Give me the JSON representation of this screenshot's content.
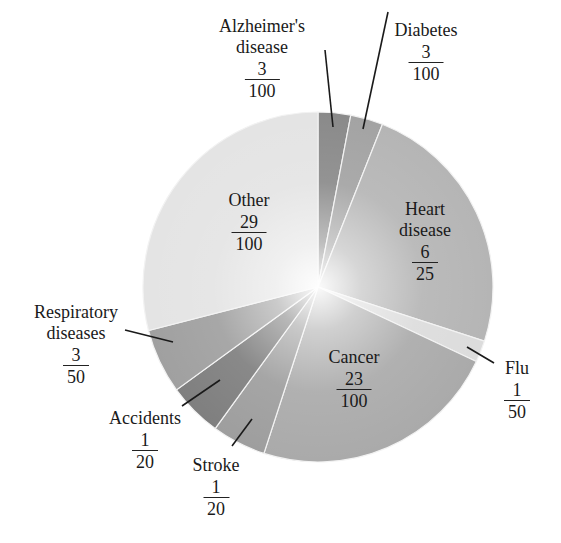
{
  "chart_data": {
    "type": "pie",
    "title": "",
    "start_angle_deg": 0,
    "direction": "clockwise",
    "slices": [
      {
        "name": "Alzheimer's disease",
        "label_lines": [
          "Alzheimer's",
          "disease"
        ],
        "num": "3",
        "den": "100",
        "value": 0.03,
        "color": "#8a8a8a"
      },
      {
        "name": "Diabetes",
        "label_lines": [
          "Diabetes"
        ],
        "num": "3",
        "den": "100",
        "value": 0.03,
        "color": "#a3a3a3"
      },
      {
        "name": "Heart disease",
        "label_lines": [
          "Heart",
          "disease"
        ],
        "num": "6",
        "den": "25",
        "value": 0.24,
        "color": "#b5b5b5"
      },
      {
        "name": "Flu",
        "label_lines": [
          "Flu"
        ],
        "num": "1",
        "den": "50",
        "value": 0.02,
        "color": "#dcdcdc"
      },
      {
        "name": "Cancer",
        "label_lines": [
          "Cancer"
        ],
        "num": "23",
        "den": "100",
        "value": 0.23,
        "color": "#aaaaaa"
      },
      {
        "name": "Stroke",
        "label_lines": [
          "Stroke"
        ],
        "num": "1",
        "den": "20",
        "value": 0.05,
        "color": "#9e9e9e"
      },
      {
        "name": "Accidents",
        "label_lines": [
          "Accidents"
        ],
        "num": "1",
        "den": "20",
        "value": 0.05,
        "color": "#7f7f7f"
      },
      {
        "name": "Respiratory diseases",
        "label_lines": [
          "Respiratory",
          "diseases"
        ],
        "num": "3",
        "den": "50",
        "value": 0.06,
        "color": "#a0a0a0"
      },
      {
        "name": "Other",
        "label_lines": [
          "Other"
        ],
        "num": "29",
        "den": "100",
        "value": 0.29,
        "color": "#e4e4e4"
      }
    ]
  },
  "labels": {
    "alzheimers": {
      "line1": "Alzheimer's",
      "line2": "disease",
      "num": "3",
      "den": "100"
    },
    "diabetes": {
      "line1": "Diabetes",
      "num": "3",
      "den": "100"
    },
    "heart": {
      "line1": "Heart",
      "line2": "disease",
      "num": "6",
      "den": "25"
    },
    "flu": {
      "line1": "Flu",
      "num": "1",
      "den": "50"
    },
    "cancer": {
      "line1": "Cancer",
      "num": "23",
      "den": "100"
    },
    "stroke": {
      "line1": "Stroke",
      "num": "1",
      "den": "20"
    },
    "accidents": {
      "line1": "Accidents",
      "num": "1",
      "den": "20"
    },
    "respiratory": {
      "line1": "Respiratory",
      "line2": "diseases",
      "num": "3",
      "den": "50"
    },
    "other": {
      "line1": "Other",
      "num": "29",
      "den": "100"
    }
  }
}
